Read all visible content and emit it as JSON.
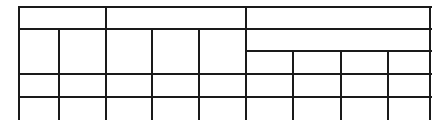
{
  "table": {
    "description": "Empty table grid with grouped header",
    "line_color": "#1a1a1a",
    "column_x": [
      19,
      59,
      106,
      152,
      199,
      246,
      293,
      341,
      388,
      430
    ],
    "header_groups": [
      {
        "label": "",
        "span": 2
      },
      {
        "label": "",
        "span": 3
      },
      {
        "label": "",
        "span": 4
      }
    ],
    "right_group_subheader": {
      "label": "",
      "span": 4
    },
    "sub_columns": [
      "",
      "",
      "",
      ""
    ],
    "rows": [
      [
        "",
        "",
        "",
        "",
        "",
        "",
        "",
        "",
        ""
      ],
      [
        "",
        "",
        "",
        "",
        "",
        "",
        "",
        "",
        ""
      ]
    ]
  }
}
